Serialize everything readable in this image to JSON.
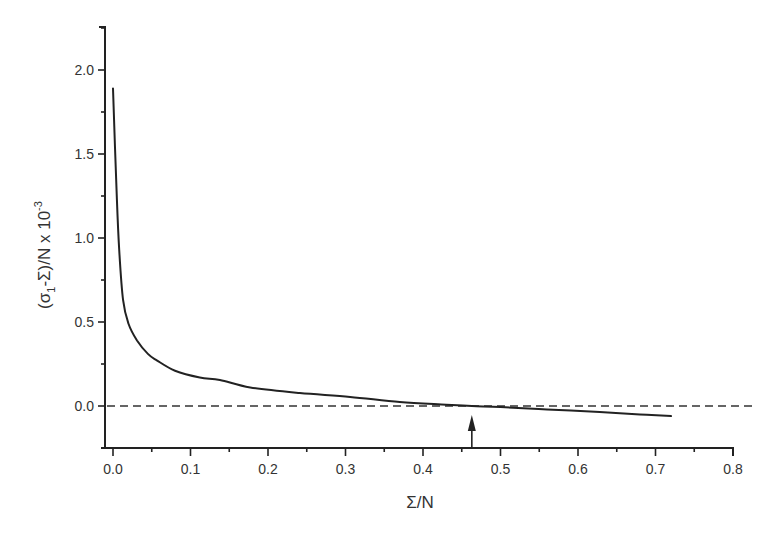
{
  "chart_data": {
    "type": "line",
    "title": "",
    "xlabel": "Σ/N",
    "ylabel": "(σ1-Σ)/N x 10-3",
    "ylabel_parts": {
      "open": "(σ",
      "sub": "1",
      "mid": "-Σ)/N x 10",
      "sup": "-3"
    },
    "xlim": [
      0.0,
      0.8
    ],
    "ylim": [
      -0.25,
      2.25
    ],
    "x_ticks": [
      "0.0",
      "0.1",
      "0.2",
      "0.3",
      "0.4",
      "0.5",
      "0.6",
      "0.7",
      "0.8"
    ],
    "y_ticks": [
      "0.0",
      "0.5",
      "1.0",
      "1.5",
      "2.0"
    ],
    "grid": false,
    "legend": null,
    "series": [
      {
        "name": "(σ1-Σ)/N",
        "color": "#222222",
        "x": [
          0.0,
          0.005,
          0.008,
          0.013,
          0.02,
          0.031,
          0.045,
          0.057,
          0.08,
          0.112,
          0.138,
          0.177,
          0.241,
          0.306,
          0.37,
          0.43,
          0.463,
          0.5,
          0.56,
          0.628,
          0.68,
          0.72
        ],
        "y": [
          1.89,
          1.23,
          0.93,
          0.63,
          0.49,
          0.39,
          0.31,
          0.27,
          0.21,
          0.17,
          0.155,
          0.11,
          0.077,
          0.054,
          0.024,
          0.008,
          0.0,
          -0.006,
          -0.02,
          -0.036,
          -0.05,
          -0.06
        ]
      }
    ],
    "annotations": [
      {
        "type": "reference-line",
        "orientation": "horizontal",
        "y": 0.0,
        "style": "dashed",
        "color": "#333333"
      },
      {
        "type": "arrow",
        "x": 0.463,
        "from_y": -0.25,
        "to_y": -0.05,
        "label": "",
        "meaning": "zero crossing of curve"
      }
    ]
  }
}
